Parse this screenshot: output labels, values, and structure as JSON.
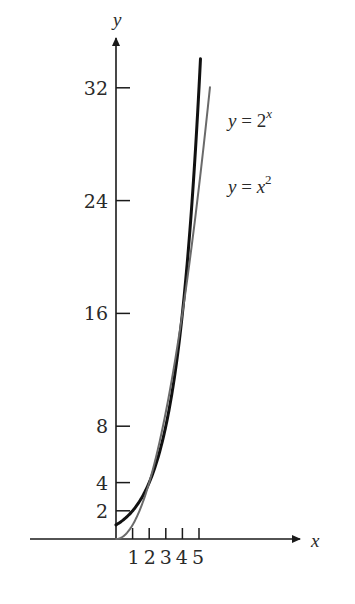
{
  "chart_data": {
    "type": "line",
    "title": "",
    "xlabel": "x",
    "ylabel": "y",
    "x_ticks": [
      1,
      2,
      3,
      4,
      5
    ],
    "x_tick_labels": [
      "1",
      "2",
      "3",
      "4",
      "5"
    ],
    "y_ticks": [
      2,
      4,
      8,
      16,
      24,
      32
    ],
    "y_tick_labels": [
      "2",
      "4",
      "8",
      "16",
      "24",
      "32"
    ],
    "xlim": [
      -5.3,
      11.0
    ],
    "ylim": [
      0,
      36
    ],
    "grid": false,
    "legend_position": "right, near top",
    "series": [
      {
        "name": "y = 2^x",
        "label_base": "y = 2",
        "label_exp": "x",
        "color": "#111111",
        "stroke_width": 3,
        "x": [
          0,
          0.5,
          1,
          1.5,
          2,
          2.5,
          3,
          3.5,
          4,
          4.5,
          5,
          5.09
        ],
        "values": [
          1,
          1.41,
          2,
          2.83,
          4,
          5.66,
          8,
          11.31,
          16,
          22.63,
          32,
          34.1
        ]
      },
      {
        "name": "y = x^2",
        "label_base": "y = x",
        "label_exp": "2",
        "color": "#6a6a6a",
        "stroke_width": 2,
        "x": [
          0,
          0.5,
          1,
          1.5,
          2,
          2.5,
          3,
          3.5,
          4,
          4.5,
          5,
          5.5,
          5.66
        ],
        "values": [
          0,
          0.25,
          1,
          2.25,
          4,
          6.25,
          9,
          12.25,
          16,
          20.25,
          25,
          30.25,
          32
        ]
      }
    ],
    "annotations": [
      "Curves intersect at (2, 4) and (4, 16)"
    ]
  },
  "layout": {
    "origin_px": [
      116,
      539
    ],
    "x_px_per_unit": 16.6,
    "y_px_per_unit": 14.1,
    "x_axis_start_px": 30,
    "x_axis_end_px": 300,
    "y_axis_top_px": 38
  }
}
